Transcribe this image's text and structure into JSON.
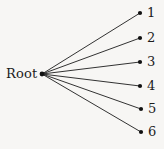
{
  "diagram": {
    "type": "tree",
    "background_color": "#f7f6f4",
    "line_color": "#1c1c1c",
    "node_color": "#111111",
    "text_color": "#1c1c1c",
    "root": {
      "label": "Root",
      "anchor_x": 42,
      "anchor_y": 74,
      "label_x": 6,
      "label_y": 65
    },
    "leaves": [
      {
        "label": "1",
        "dot_x": 140,
        "dot_y": 13,
        "label_x": 147,
        "label_y": 6
      },
      {
        "label": "2",
        "dot_x": 140,
        "dot_y": 38,
        "label_x": 147,
        "label_y": 31
      },
      {
        "label": "3",
        "dot_x": 140,
        "dot_y": 62,
        "label_x": 147,
        "label_y": 55
      },
      {
        "label": "4",
        "dot_x": 140,
        "dot_y": 86,
        "label_x": 147,
        "label_y": 79
      },
      {
        "label": "5",
        "dot_x": 141,
        "dot_y": 109,
        "label_x": 148,
        "label_y": 102
      },
      {
        "label": "6",
        "dot_x": 141,
        "dot_y": 132,
        "label_x": 148,
        "label_y": 125
      }
    ]
  }
}
